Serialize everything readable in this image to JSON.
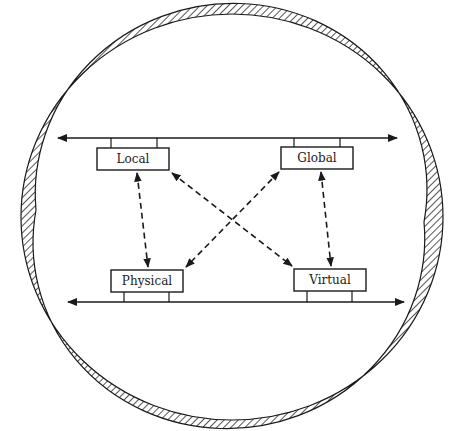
{
  "diagram": {
    "type": "network-ring",
    "colors": {
      "stroke": "#1a1a1a",
      "background": "#ffffff",
      "hatch": "#2a2a2a"
    },
    "nodes": [
      {
        "id": "local",
        "label": "Local"
      },
      {
        "id": "global",
        "label": "Global"
      },
      {
        "id": "physical",
        "label": "Physical"
      },
      {
        "id": "virtual",
        "label": "Virtual"
      }
    ],
    "buses": [
      {
        "id": "top-bus",
        "attached": [
          "local",
          "global"
        ],
        "direction": "bidirectional"
      },
      {
        "id": "bottom-bus",
        "attached": [
          "physical",
          "virtual"
        ],
        "direction": "bidirectional"
      }
    ],
    "edges": [
      {
        "from": "local",
        "to": "physical",
        "style": "dashed",
        "direction": "bidirectional"
      },
      {
        "from": "global",
        "to": "virtual",
        "style": "dashed",
        "direction": "bidirectional"
      },
      {
        "from": "local",
        "to": "virtual",
        "style": "dashed",
        "direction": "bidirectional"
      },
      {
        "from": "global",
        "to": "physical",
        "style": "dashed",
        "direction": "bidirectional"
      }
    ],
    "enclosure": {
      "shape": "hatched-ellipse-ring"
    }
  }
}
